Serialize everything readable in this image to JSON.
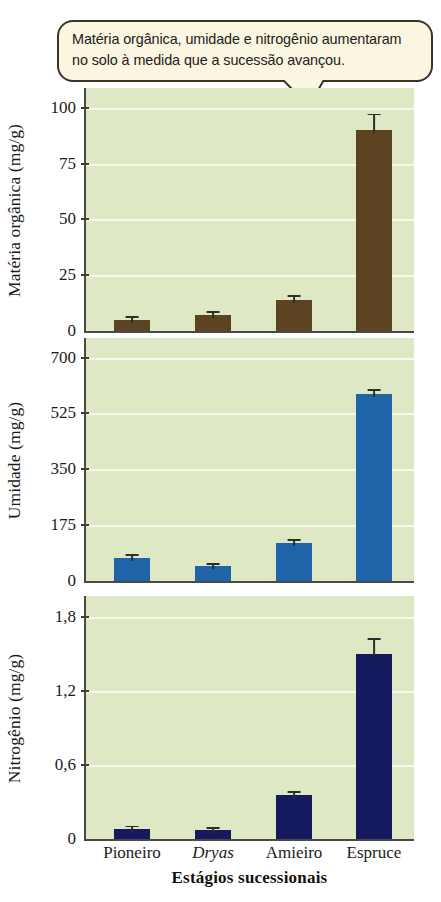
{
  "callout": {
    "text": "Matéria orgânica, umidade e nitrogênio aumentaram no solo à medida que a sucessão avançou.",
    "background": "#fbf6e2",
    "border_color": "#3a3326"
  },
  "figure": {
    "xlabel": "Estágios sucessionais",
    "categories": [
      "Pioneiro",
      "Dryas",
      "Amieiro",
      "Espruce"
    ],
    "italic_categories": [
      "Dryas"
    ],
    "plot_background": "#dfe8c4",
    "gridline_color": "#f7f9ee"
  },
  "chart_data": [
    {
      "type": "bar",
      "title": "",
      "ylabel": "Matéria orgânica (mg/g)",
      "xlabel": "Estágios sucessionais",
      "categories": [
        "Pioneiro",
        "Dryas",
        "Amieiro",
        "Espruce"
      ],
      "values": [
        5,
        7,
        14,
        90
      ],
      "errors": [
        1.2,
        1.5,
        1.5,
        7
      ],
      "yticks": [
        0,
        25,
        50,
        75,
        100
      ],
      "ytick_labels": [
        "0",
        "25",
        "50",
        "75",
        "100"
      ],
      "ylim": [
        0,
        108
      ],
      "bar_color": "#5c4422",
      "grid": true,
      "legend": "none"
    },
    {
      "type": "bar",
      "title": "",
      "ylabel": "Umidade (mg/g)",
      "xlabel": "Estágios sucessionais",
      "categories": [
        "Pioneiro",
        "Dryas",
        "Amieiro",
        "Espruce"
      ],
      "values": [
        72,
        48,
        120,
        585
      ],
      "errors": [
        8,
        6,
        8,
        14
      ],
      "yticks": [
        0,
        175,
        350,
        525,
        700
      ],
      "ytick_labels": [
        "0",
        "175",
        "350",
        "525",
        "700"
      ],
      "ylim": [
        0,
        755
      ],
      "bar_color": "#1f64a8",
      "grid": true,
      "legend": "none"
    },
    {
      "type": "bar",
      "title": "",
      "ylabel": "Nitrogênio (mg/g)",
      "xlabel": "Estágios sucessionais",
      "categories": [
        "Pioneiro",
        "Dryas",
        "Amieiro",
        "Espruce"
      ],
      "values": [
        0.08,
        0.07,
        0.36,
        1.5
      ],
      "errors": [
        0.02,
        0.02,
        0.02,
        0.12
      ],
      "yticks": [
        0,
        0.6,
        1.2,
        1.8
      ],
      "ytick_labels": [
        "0",
        "0,6",
        "1,2",
        "1,8"
      ],
      "ylim": [
        0,
        1.95
      ],
      "bar_color": "#151a5e",
      "grid": true,
      "legend": "none"
    }
  ]
}
